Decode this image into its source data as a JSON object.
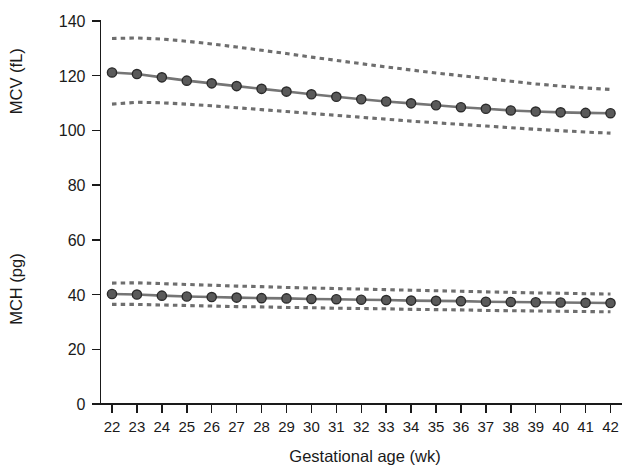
{
  "chart_data": {
    "type": "line",
    "title": "",
    "xlabel": "Gestational age (wk)",
    "ylabel_top": "MCV (fL)",
    "ylabel_bottom": "MCH (pg)",
    "xlim": [
      21.5,
      42.5
    ],
    "ylim": [
      0,
      140
    ],
    "yticks": [
      0,
      20,
      40,
      60,
      80,
      100,
      120,
      140
    ],
    "ytick_labels": [
      "0",
      "20",
      "40",
      "60",
      "80",
      "100",
      "120",
      "140"
    ],
    "x": [
      22,
      23,
      24,
      25,
      26,
      27,
      28,
      29,
      30,
      31,
      32,
      33,
      34,
      35,
      36,
      37,
      38,
      39,
      40,
      41,
      42
    ],
    "xtick_labels": [
      "22",
      "23",
      "24",
      "25",
      "26",
      "27",
      "28",
      "29",
      "30",
      "31",
      "32",
      "33",
      "34",
      "35",
      "36",
      "37",
      "38",
      "39",
      "40",
      "41",
      "42"
    ],
    "grid": false,
    "legend": "none",
    "series": [
      {
        "name": "MCV mean",
        "style": "solid-with-markers",
        "color": "#757575",
        "values": [
          121.2,
          120.6,
          119.4,
          118.2,
          117.2,
          116.2,
          115.2,
          114.2,
          113.2,
          112.3,
          111.4,
          110.6,
          109.9,
          109.2,
          108.5,
          107.9,
          107.3,
          106.9,
          106.6,
          106.4,
          106.3
        ]
      },
      {
        "name": "MCV upper limit",
        "style": "dashed",
        "color": "#6e6e6e",
        "values": [
          133.6,
          133.8,
          133.4,
          132.6,
          131.6,
          130.5,
          129.3,
          128.1,
          126.8,
          125.6,
          124.4,
          123.2,
          122.1,
          121.0,
          120.0,
          119.0,
          118.0,
          117.0,
          116.2,
          115.5,
          115.0
        ]
      },
      {
        "name": "MCV lower limit",
        "style": "dashed",
        "color": "#6e6e6e",
        "values": [
          109.6,
          110.3,
          110.1,
          109.6,
          109.0,
          108.3,
          107.6,
          106.9,
          106.2,
          105.5,
          104.8,
          104.1,
          103.4,
          102.8,
          102.2,
          101.6,
          101.0,
          100.4,
          99.9,
          99.4,
          99.0
        ]
      },
      {
        "name": "MCH mean",
        "style": "solid-with-markers",
        "color": "#757575",
        "values": [
          40.2,
          40.0,
          39.6,
          39.3,
          39.1,
          38.9,
          38.7,
          38.6,
          38.4,
          38.3,
          38.1,
          38.0,
          37.8,
          37.7,
          37.6,
          37.4,
          37.3,
          37.2,
          37.1,
          37.0,
          36.9
        ]
      },
      {
        "name": "MCH upper limit",
        "style": "dashed",
        "color": "#6e6e6e",
        "values": [
          44.2,
          44.3,
          44.0,
          43.7,
          43.4,
          43.1,
          42.9,
          42.6,
          42.4,
          42.2,
          42.0,
          41.8,
          41.6,
          41.4,
          41.2,
          41.0,
          40.8,
          40.6,
          40.5,
          40.3,
          40.2
        ]
      },
      {
        "name": "MCH lower limit",
        "style": "dashed",
        "color": "#6e6e6e",
        "values": [
          36.4,
          36.4,
          36.2,
          36.0,
          35.8,
          35.6,
          35.5,
          35.3,
          35.2,
          35.0,
          34.9,
          34.8,
          34.6,
          34.5,
          34.4,
          34.2,
          34.1,
          34.0,
          33.9,
          33.8,
          33.7
        ]
      }
    ]
  },
  "colors": {
    "axis": "#1a1a1a",
    "line": "#757575",
    "band": "#6e6e6e",
    "marker_fill": "#5a5a5a",
    "marker_stroke": "#2b2b2b",
    "background": "#ffffff"
  }
}
